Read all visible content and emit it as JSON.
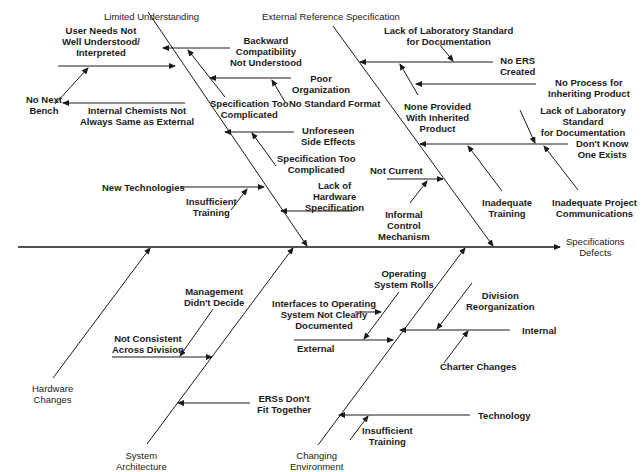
{
  "diagram": {
    "type": "fishbone",
    "effect": "Specifications\nDefects",
    "top_cut_caption": "",
    "categories": [
      {
        "id": "limited",
        "label": "Limited Understanding",
        "causes": [
          {
            "label": "User Needs Not\nWell Understood/\nInterpreted",
            "subs": [
              "No Next\nBench",
              "Internal Chemists Not\nAlways Same as External"
            ]
          },
          {
            "label": "Backward\nCompatibility\nNot Understood",
            "subs": [
              "Specification Too\nComplicated"
            ]
          },
          {
            "label": "Poor\nOrganization",
            "subs": [
              "No Standard Format"
            ]
          },
          {
            "label": "Unforeseen\nSide Effects",
            "subs": [
              "Specification Too\nComplicated"
            ]
          },
          {
            "label": "New Technologies",
            "subs": [
              "Insufficient\nTraining"
            ]
          },
          {
            "label": "Lack of\nHardware\nSpecification",
            "subs": []
          }
        ]
      },
      {
        "id": "ers",
        "label": "External Reference Specification",
        "causes": [
          {
            "label": "No ERS\nCreated",
            "subs": [
              "Lack of Laboratory Standard\nfor Documentation",
              "None Provided\nWith Inherited\nProduct"
            ]
          },
          {
            "label": "No Process for\nInheriting Product",
            "subs": []
          },
          {
            "label": "Don't Know\nOne Exists",
            "subs": [
              "Lack of Laboratory Standard\nfor Documentation",
              "Inadequate\nTraining",
              "Inadequate Project\nCommunications"
            ]
          },
          {
            "label": "Not Current",
            "subs": [
              "Informal\nControl\nMechanism"
            ]
          }
        ]
      },
      {
        "id": "hardware",
        "label": "Hardware\nChanges",
        "causes": []
      },
      {
        "id": "sysarch",
        "label": "System\nArchitecture",
        "causes": [
          {
            "label": "Not Consistent\nAcross Division",
            "subs": [
              "Management\nDidn't Decide"
            ]
          },
          {
            "label": "ERSs Don't\nFit Together",
            "subs": []
          }
        ]
      },
      {
        "id": "env",
        "label": "Changing\nEnvironment",
        "causes": [
          {
            "label": "External",
            "subs": [
              "Operating\nSystem Rolls",
              "Interfaces to Operating\nSystem Not Clearly\nDocumented"
            ]
          },
          {
            "label": "Internal",
            "subs": [
              "Division\nReorganization",
              "Charter Changes"
            ]
          },
          {
            "label": "Technology",
            "subs": [
              "Insufficient\nTraining"
            ]
          }
        ]
      }
    ]
  },
  "labels": {
    "cat_limited": "Limited Understanding",
    "cat_ers": "External Reference Specification",
    "cat_hardware": "Hardware\nChanges",
    "cat_sysarch": "System\nArchitecture",
    "cat_env": "Changing\nEnvironment",
    "effect": "Specifications\nDefects",
    "user_needs": "User Needs Not\nWell Understood/\nInterpreted",
    "no_next_bench": "No Next\nBench",
    "internal_chemists": "Internal Chemists Not\nAlways Same as External",
    "backward_compat": "Backward\nCompatibility\nNot Understood",
    "spec_too_complicated_1": "Specification Too\nComplicated",
    "poor_org": "Poor\nOrganization",
    "no_std_format": "No Standard Format",
    "unforeseen": "Unforeseen\nSide Effects",
    "spec_too_complicated_2": "Specification Too\nComplicated",
    "new_tech": "New Technologies",
    "insufficient_training_1": "Insufficient\nTraining",
    "lack_hw_spec": "Lack of\nHardware\nSpecification",
    "lack_lab_std_1": "Lack of Laboratory Standard\nfor Documentation",
    "no_ers": "No ERS\nCreated",
    "no_process": "No Process for\nInheriting Product",
    "none_provided": "None Provided\nWith Inherited\nProduct",
    "lack_lab_std_2": "Lack of Laboratory Standard\nfor Documentation",
    "dont_know": "Don't Know\nOne Exists",
    "not_current": "Not Current",
    "informal_control": "Informal\nControl\nMechanism",
    "inadequate_training": "Inadequate\nTraining",
    "inadequate_comm": "Inadequate Project\nCommunications",
    "mgmt_didnt_decide": "Management\nDidn't Decide",
    "not_consistent": "Not Consistent\nAcross Division",
    "erss_dont_fit": "ERSs Don't\nFit Together",
    "os_rolls": "Operating\nSystem Rolls",
    "interfaces_os": "Interfaces to Operating\nSystem Not Clearly\nDocumented",
    "external": "External",
    "division_reorg": "Division\nReorganization",
    "internal": "Internal",
    "charter_changes": "Charter Changes",
    "technology": "Technology",
    "insufficient_training_2": "Insufficient\nTraining"
  },
  "colors": {
    "line": "#1a1a1a",
    "background": "#ffffff"
  }
}
